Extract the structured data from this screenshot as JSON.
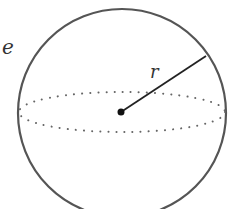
{
  "diagram": {
    "type": "sphere",
    "labels": {
      "radius": "r",
      "partial_left": "e"
    },
    "colors": {
      "outline": "#555555",
      "radius_line": "#222222",
      "center_point": "#111111",
      "equator": "#666666",
      "label": "#333333"
    }
  }
}
